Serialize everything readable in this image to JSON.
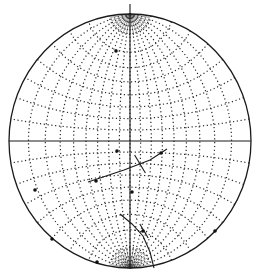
{
  "diagram": {
    "type": "stereonet",
    "projection": "equal-angle (Wulff) net",
    "grid_interval_deg": 10,
    "colors": {
      "ink": "#1a1a1a",
      "background": "#ffffff"
    },
    "frame": {
      "cx": 130,
      "cy": 141,
      "rx": 121,
      "ry": 127,
      "north_tick_top": 4
    },
    "great_circles": [
      {
        "name": "plane-trace-1",
        "points": [
          [
            88,
            182
          ],
          [
            124,
            170
          ],
          [
            150,
            160
          ],
          [
            167,
            149
          ]
        ]
      },
      {
        "name": "plane-trace-2",
        "points": [
          [
            120,
            214
          ],
          [
            132,
            224
          ],
          [
            143,
            236
          ],
          [
            150,
            252
          ],
          [
            154,
            268
          ]
        ]
      }
    ],
    "markers": [
      {
        "name": "intersection-cross-1",
        "center": [
          140,
          164
        ],
        "size": 9
      },
      {
        "name": "intersection-cross-2",
        "center": [
          144,
          231
        ],
        "size": 7
      }
    ],
    "points": [
      [
        116,
        51
      ],
      [
        117,
        151
      ],
      [
        161,
        153
      ],
      [
        96,
        181
      ],
      [
        132,
        192
      ],
      [
        143,
        231
      ],
      [
        215,
        231
      ],
      [
        97,
        262
      ],
      [
        52,
        239
      ],
      [
        35,
        190
      ]
    ]
  }
}
